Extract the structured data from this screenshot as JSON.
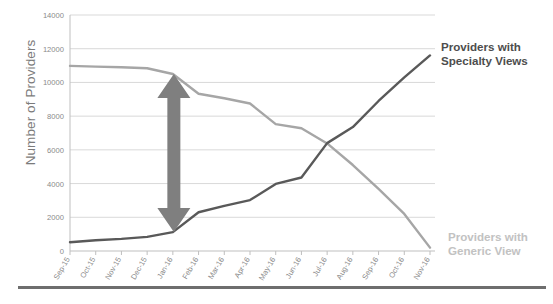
{
  "chart_data": {
    "type": "line",
    "title": "",
    "xlabel": "",
    "ylabel": "Number of Providers",
    "ylim": [
      0,
      14000
    ],
    "ytick_labels": [
      "0",
      "2000",
      "4000",
      "6000",
      "8000",
      "10000",
      "12000",
      "14000"
    ],
    "ytick_values": [
      0,
      2000,
      4000,
      6000,
      8000,
      10000,
      12000,
      14000
    ],
    "grid": true,
    "legend_position": "right-inline",
    "categories": [
      "Sep-15",
      "Oct-15",
      "Nov-15",
      "Dec-15",
      "Jan-16",
      "Feb-16",
      "Mar-16",
      "Apr-16",
      "May-16",
      "Jun-16",
      "Jul-16",
      "Aug-16",
      "Sep-16",
      "Oct-16",
      "Nov-16"
    ],
    "series": [
      {
        "name": "Providers with Generic View",
        "color": "#a6a6a6",
        "values": [
          10980,
          10940,
          10900,
          10840,
          10500,
          9330,
          9060,
          8750,
          7530,
          7280,
          6380,
          5100,
          3680,
          2200,
          200
        ]
      },
      {
        "name": "Providers with Specialty Views",
        "color": "#595959",
        "values": [
          520,
          640,
          720,
          840,
          1120,
          2300,
          2680,
          3020,
          3980,
          4360,
          6400,
          7350,
          8900,
          10300,
          11600
        ]
      }
    ],
    "annotations": [
      {
        "type": "double-arrow",
        "label": "gap-arrow",
        "color": "#7f7f7f",
        "x_category": "Jan-16",
        "from_value": 1120,
        "to_value": 10500
      }
    ]
  },
  "legend": {
    "specialty": {
      "line1": "Providers with",
      "line2": "Specialty Views",
      "color": "#4d4d4d"
    },
    "generic": {
      "line1": "Providers with",
      "line2": "Generic View",
      "color": "#c2c2c2"
    }
  },
  "axis": {
    "y_title": "Number of Providers"
  }
}
